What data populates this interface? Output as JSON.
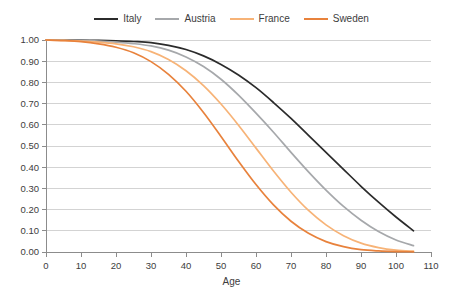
{
  "chart_data": {
    "type": "line",
    "title": "",
    "xlabel": "Age",
    "ylabel": "",
    "xlim": [
      0,
      110
    ],
    "ylim": [
      0,
      1.0
    ],
    "grid": "horizontal",
    "legend_position": "top-center",
    "x_ticks": [
      "0",
      "10",
      "20",
      "30",
      "40",
      "50",
      "60",
      "70",
      "80",
      "90",
      "100",
      "110"
    ],
    "y_ticks": [
      "0.00",
      "0.10",
      "0.20",
      "0.30",
      "0.40",
      "0.50",
      "0.60",
      "0.70",
      "0.80",
      "0.90",
      "1.00"
    ],
    "x": [
      0,
      5,
      10,
      15,
      20,
      25,
      30,
      35,
      40,
      45,
      50,
      55,
      60,
      65,
      70,
      75,
      80,
      85,
      90,
      95,
      100,
      105
    ],
    "series": [
      {
        "name": "Italy",
        "color": "#2b2b2b",
        "values": [
          1.0,
          1.0,
          0.999,
          0.998,
          0.996,
          0.993,
          0.988,
          0.975,
          0.955,
          0.925,
          0.885,
          0.835,
          0.775,
          0.705,
          0.63,
          0.55,
          0.47,
          0.39,
          0.31,
          0.235,
          0.165,
          0.1
        ]
      },
      {
        "name": "Austria",
        "color": "#a6a8ab",
        "values": [
          1.0,
          0.999,
          0.998,
          0.995,
          0.99,
          0.983,
          0.972,
          0.952,
          0.92,
          0.875,
          0.815,
          0.74,
          0.655,
          0.565,
          0.47,
          0.378,
          0.292,
          0.215,
          0.15,
          0.097,
          0.057,
          0.03
        ]
      },
      {
        "name": "France",
        "color": "#f7b377",
        "values": [
          1.0,
          0.998,
          0.995,
          0.99,
          0.982,
          0.968,
          0.945,
          0.908,
          0.855,
          0.785,
          0.698,
          0.598,
          0.49,
          0.382,
          0.282,
          0.196,
          0.128,
          0.077,
          0.042,
          0.021,
          0.009,
          0.004
        ]
      },
      {
        "name": "Sweden",
        "color": "#e8823c",
        "values": [
          1.0,
          0.997,
          0.992,
          0.982,
          0.966,
          0.94,
          0.898,
          0.838,
          0.758,
          0.658,
          0.545,
          0.428,
          0.318,
          0.222,
          0.145,
          0.088,
          0.049,
          0.025,
          0.011,
          0.005,
          0.002,
          0.001
        ]
      }
    ]
  },
  "legend": {
    "items": [
      {
        "label": "Italy",
        "color": "#2b2b2b"
      },
      {
        "label": "Austria",
        "color": "#a6a8ab"
      },
      {
        "label": "France",
        "color": "#f7b377"
      },
      {
        "label": "Sweden",
        "color": "#e8823c"
      }
    ]
  },
  "axes": {
    "x_title": "Age",
    "y_title": ""
  }
}
